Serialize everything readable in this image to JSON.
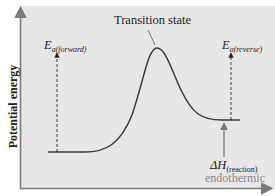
{
  "diagram": {
    "type": "energy-profile",
    "y_axis_label": "Potential energy",
    "peak_label": "Transition state",
    "ea_forward": {
      "symbol": "E",
      "subscript": "a(forward)"
    },
    "ea_reverse": {
      "symbol": "E",
      "subscript": "a(reverse)"
    },
    "delta_h": {
      "symbol": "ΔH",
      "subscript": "(reaction)"
    },
    "reaction_type": "endothermic",
    "colors": {
      "panel": "#e7e7e7",
      "axis": "#7a7a7a",
      "curve": "#3a3a3a",
      "label": "#222222",
      "endothermic_label": "#8a8a8a"
    }
  }
}
